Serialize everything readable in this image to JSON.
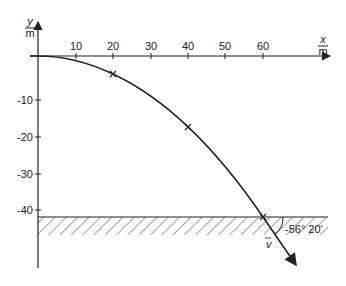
{
  "diagram": {
    "type": "projectile-trajectory",
    "x_axis": {
      "label_num": "x",
      "label_den": "m",
      "ticks": [
        "10",
        "20",
        "30",
        "40",
        "50",
        "60"
      ]
    },
    "y_axis": {
      "label_num": "y",
      "label_den": "m",
      "ticks": [
        "-10",
        "-20",
        "-30",
        "-40"
      ]
    },
    "marked_points": [
      {
        "x": 20,
        "y": -5
      },
      {
        "x": 40,
        "y": -20
      },
      {
        "x": 60,
        "y": -45
      }
    ],
    "ground_level": -45,
    "velocity_label": "v",
    "angle_label": "-56° 20'",
    "colors": {
      "ink": "#222222",
      "background": "#ffffff"
    }
  }
}
